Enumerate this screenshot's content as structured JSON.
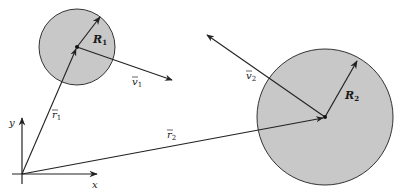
{
  "diagram": {
    "colors": {
      "line": "#222222",
      "fill": "#c8c8c8",
      "background": "#ffffff"
    },
    "axes": {
      "origin": [
        22,
        174
      ],
      "x_label": "x",
      "y_label": "y"
    },
    "bodies": [
      {
        "id": "body-1",
        "center": [
          77,
          47
        ],
        "radius": 38,
        "radius_label": "R",
        "radius_sub": "1",
        "position_label": "r",
        "position_sub": "1",
        "velocity_label": "v",
        "velocity_sub": "1"
      },
      {
        "id": "body-2",
        "center": [
          325,
          117
        ],
        "radius": 68,
        "radius_label": "R",
        "radius_sub": "2",
        "position_label": "r",
        "position_sub": "2",
        "velocity_label": "v",
        "velocity_sub": "2"
      }
    ]
  }
}
